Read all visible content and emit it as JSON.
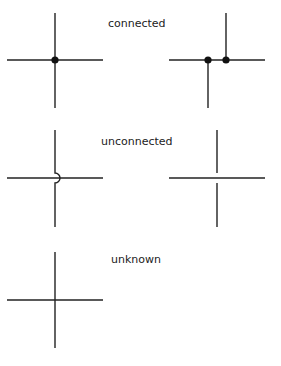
{
  "colors": {
    "line": "#222222",
    "dot": "#111111",
    "label": "#222222",
    "background": "#ffffff"
  },
  "labels": {
    "connected": "connected",
    "unconnected": "unconnected",
    "unknown": "unknown"
  },
  "sections": [
    {
      "id": "connected",
      "label": "connected",
      "examples": [
        "four-way junction with dot",
        "two offset T-junctions with dots"
      ]
    },
    {
      "id": "unconnected",
      "label": "unconnected",
      "examples": [
        "crossing with hop arc",
        "crossing with gap in vertical wire"
      ]
    },
    {
      "id": "unknown",
      "label": "unknown",
      "examples": [
        "plain crossing, no dot"
      ]
    }
  ]
}
